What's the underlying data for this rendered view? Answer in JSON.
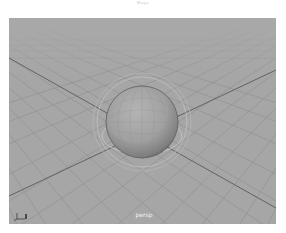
{
  "window": {
    "title": "Maya"
  },
  "viewport": {
    "camera_label": "persp",
    "background_color": "#a6a6a6",
    "grid_color": "#8e8e8e",
    "axis_line_color": "#5a5a5a",
    "axis_gizmo": {
      "icon": "axis-gizmo-icon",
      "axes": [
        "x",
        "y",
        "z"
      ]
    },
    "objects": [
      {
        "type": "sphere",
        "name": "pSphere1",
        "selected": false,
        "color": "#9c9c9c"
      }
    ],
    "manipulator": {
      "type": "rotate-rings",
      "color": "#c4c4c4"
    }
  }
}
